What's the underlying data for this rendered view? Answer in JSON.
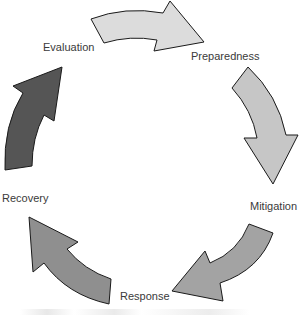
{
  "diagram": {
    "type": "cycle",
    "stages": [
      {
        "label": "Preparedness",
        "arrow_color": "#dcdcdc"
      },
      {
        "label": "Mitigation",
        "arrow_color": "#c6c6c6"
      },
      {
        "label": "Response",
        "arrow_color": "#a3a3a3"
      },
      {
        "label": "Recovery",
        "arrow_color": "#8f8f8f"
      },
      {
        "label": "Evaluation",
        "arrow_color": "#555555"
      }
    ],
    "direction": "clockwise",
    "outline_color": "#1a1a1a",
    "label_color": "#3a3a3a"
  }
}
